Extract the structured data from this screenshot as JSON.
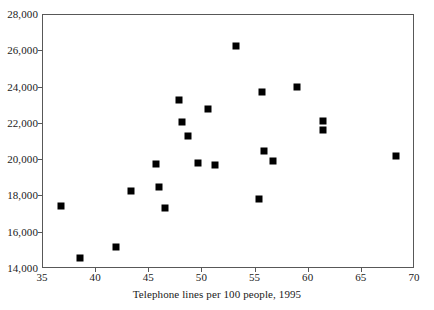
{
  "chart_data": {
    "type": "scatter",
    "title": "",
    "xlabel": "Telephone lines per 100 people, 1995",
    "ylabel": "",
    "xlim": [
      35,
      70
    ],
    "ylim": [
      14000,
      28000
    ],
    "xticks": [
      35,
      40,
      45,
      50,
      55,
      60,
      65,
      70
    ],
    "xtick_labels": [
      "35",
      "40",
      "45",
      "50",
      "55",
      "60",
      "65",
      "70"
    ],
    "yticks": [
      14000,
      16000,
      18000,
      20000,
      22000,
      24000,
      26000,
      28000
    ],
    "ytick_labels": [
      "14,000",
      "16,000",
      "18,000",
      "20,000",
      "22,000",
      "24,000",
      "26,000",
      "28,000"
    ],
    "grid": false,
    "legend": false,
    "marker": "filled-square",
    "marker_color": "#000000",
    "series": [
      {
        "name": "countries",
        "points": [
          {
            "x": 36.7,
            "y": 17450
          },
          {
            "x": 38.5,
            "y": 14600
          },
          {
            "x": 41.9,
            "y": 15200
          },
          {
            "x": 43.3,
            "y": 18300
          },
          {
            "x": 45.6,
            "y": 19800
          },
          {
            "x": 45.9,
            "y": 18500
          },
          {
            "x": 46.5,
            "y": 17350
          },
          {
            "x": 47.8,
            "y": 23300
          },
          {
            "x": 48.1,
            "y": 22100
          },
          {
            "x": 48.6,
            "y": 21350
          },
          {
            "x": 49.6,
            "y": 19850
          },
          {
            "x": 50.5,
            "y": 22800
          },
          {
            "x": 51.2,
            "y": 19750
          },
          {
            "x": 53.2,
            "y": 26300
          },
          {
            "x": 55.3,
            "y": 17850
          },
          {
            "x": 55.8,
            "y": 20500
          },
          {
            "x": 56.6,
            "y": 19950
          },
          {
            "x": 55.6,
            "y": 23750
          },
          {
            "x": 58.9,
            "y": 24050
          },
          {
            "x": 61.3,
            "y": 22150
          },
          {
            "x": 61.3,
            "y": 21650
          },
          {
            "x": 68.2,
            "y": 20250
          }
        ]
      }
    ]
  },
  "footnote": ""
}
